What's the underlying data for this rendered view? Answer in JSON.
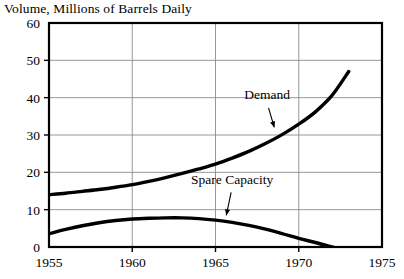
{
  "chart_data": {
    "type": "line",
    "title": "Volume, Millions of Barrels Daily",
    "xlabel": "",
    "ylabel": "",
    "xlim": [
      1955,
      1975
    ],
    "ylim": [
      0,
      60
    ],
    "xticks": [
      "1955",
      "1960",
      "1965",
      "1970",
      "1975"
    ],
    "yticks": [
      "0",
      "10",
      "20",
      "30",
      "40",
      "50",
      "60"
    ],
    "grid": true,
    "legend_position": "inline-annotations",
    "series": [
      {
        "name": "Demand",
        "label": "Demand",
        "x": [
          1955,
          1956,
          1957,
          1958,
          1959,
          1960,
          1961,
          1962,
          1963,
          1964,
          1965,
          1966,
          1967,
          1968,
          1969,
          1970,
          1971,
          1972,
          1973
        ],
        "values": [
          14.0,
          14.4,
          14.9,
          15.4,
          16.0,
          16.7,
          17.6,
          18.6,
          19.7,
          20.9,
          22.2,
          23.8,
          25.6,
          27.7,
          30.1,
          32.9,
          36.2,
          40.6,
          47.0
        ]
      },
      {
        "name": "Spare Capacity",
        "label": "Spare Capacity",
        "x": [
          1955,
          1956,
          1957,
          1958,
          1959,
          1960,
          1961,
          1962,
          1963,
          1964,
          1965,
          1966,
          1967,
          1968,
          1969,
          1970,
          1971,
          1972,
          1973
        ],
        "values": [
          3.5,
          4.7,
          5.7,
          6.5,
          7.1,
          7.5,
          7.7,
          7.8,
          7.8,
          7.6,
          7.2,
          6.6,
          5.8,
          4.8,
          3.6,
          2.3,
          1.2,
          0.0,
          -1.2
        ]
      }
    ],
    "annotations": [
      {
        "text": "Demand",
        "text_x": 1968.1,
        "text_y": 39.6,
        "arrow_to_x": 1968.6,
        "arrow_to_y": 31.0
      },
      {
        "text": "Spare Capacity",
        "text_x": 1966.0,
        "text_y": 17.0,
        "arrow_to_x": 1965.6,
        "arrow_to_y": 7.4
      }
    ]
  }
}
